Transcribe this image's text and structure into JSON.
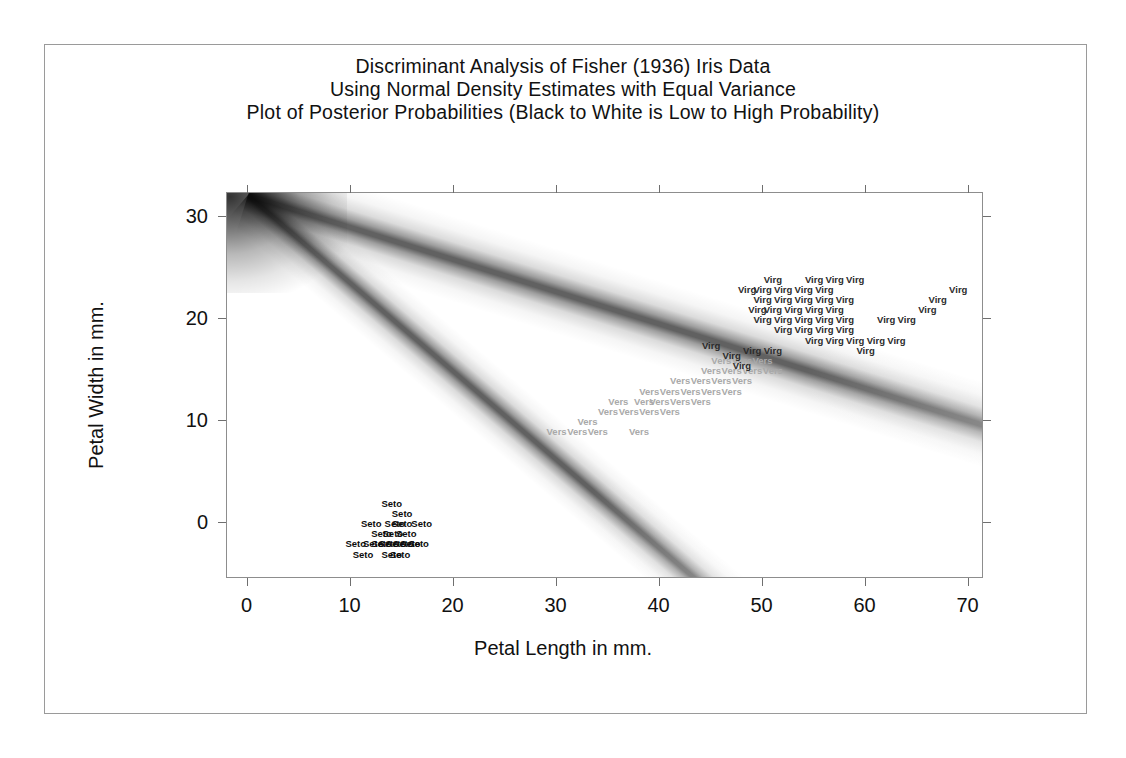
{
  "title": {
    "line1": "Discriminant Analysis of Fisher (1936) Iris Data",
    "line2": "Using Normal Density Estimates with Equal Variance",
    "line3": "Plot of Posterior Probabilities (Black to White is Low to High Probability)"
  },
  "axes": {
    "xlabel": "Petal Length in mm.",
    "ylabel": "Petal Width in mm.",
    "xticks": [
      "0",
      "10",
      "20",
      "30",
      "40",
      "50",
      "60",
      "70"
    ],
    "yticks": [
      "0",
      "10",
      "20",
      "30"
    ],
    "xlim": [
      -2,
      71.5
    ],
    "ylim": [
      -5.5,
      32.4
    ]
  },
  "chart_data": {
    "type": "scatter",
    "title": "Discriminant Analysis of Fisher (1936) Iris Data",
    "subtitle": "Using Normal Density Estimates with Equal Variance",
    "annotation": "Plot of Posterior Probabilities (Black to White is Low to High Probability)",
    "xlabel": "Petal Length in mm.",
    "ylabel": "Petal Width in mm.",
    "xlim": [
      -2,
      71.5
    ],
    "ylim": [
      -5.5,
      32.4
    ],
    "grid": false,
    "legend": "none",
    "background": "posterior probability density shading: two dark decision-boundary ridges radiating from upper-left corner; black = low probability, white = high probability",
    "boundaries": [
      {
        "name": "seto-vers-boundary",
        "from": [
          0,
          32.2
        ],
        "to": [
          43.5,
          -5.5
        ]
      },
      {
        "name": "vers-virg-boundary",
        "from": [
          0,
          32.2
        ],
        "to": [
          71.5,
          9.6
        ]
      }
    ],
    "series": [
      {
        "name": "Seto",
        "label": "Seto",
        "color": "#0c0c0c",
        "points": [
          [
            14.0,
            2.0
          ],
          [
            15.0,
            1.0
          ],
          [
            12.0,
            0.0
          ],
          [
            14.3,
            0.0
          ],
          [
            15.0,
            0.0
          ],
          [
            16.9,
            0.0
          ],
          [
            13.0,
            -1.0
          ],
          [
            14.1,
            -1.0
          ],
          [
            15.4,
            -1.0
          ],
          [
            10.5,
            -2.0
          ],
          [
            12.2,
            -2.0
          ],
          [
            13.0,
            -2.0
          ],
          [
            13.7,
            -2.0
          ],
          [
            14.4,
            -2.0
          ],
          [
            15.1,
            -2.0
          ],
          [
            15.8,
            -2.0
          ],
          [
            16.6,
            -2.0
          ],
          [
            11.2,
            -3.0
          ],
          [
            14.0,
            -3.0
          ],
          [
            14.8,
            -3.0
          ]
        ]
      },
      {
        "name": "Vers",
        "label": "Vers",
        "color": "#a9a9a9",
        "points": [
          [
            33.0,
            10.0
          ],
          [
            30.0,
            9.0
          ],
          [
            32.0,
            9.0
          ],
          [
            34.0,
            9.0
          ],
          [
            38.0,
            9.0
          ],
          [
            35.0,
            11.0
          ],
          [
            37.0,
            11.0
          ],
          [
            39.0,
            11.0
          ],
          [
            41.0,
            11.0
          ],
          [
            36.0,
            12.0
          ],
          [
            38.5,
            12.0
          ],
          [
            40.0,
            12.0
          ],
          [
            42.0,
            12.0
          ],
          [
            44.0,
            12.0
          ],
          [
            39.0,
            13.0
          ],
          [
            41.0,
            13.0
          ],
          [
            43.0,
            13.0
          ],
          [
            45.0,
            13.0
          ],
          [
            47.0,
            13.0
          ],
          [
            42.0,
            14.0
          ],
          [
            44.0,
            14.0
          ],
          [
            46.0,
            14.0
          ],
          [
            48.0,
            14.0
          ],
          [
            45.0,
            15.0
          ],
          [
            47.0,
            15.0
          ],
          [
            49.0,
            15.0
          ],
          [
            51.0,
            15.0
          ],
          [
            46.0,
            16.0
          ],
          [
            48.0,
            16.0
          ],
          [
            50.0,
            16.0
          ]
        ]
      },
      {
        "name": "Virg",
        "label": "Virg",
        "color": "#2b2b2b",
        "points": [
          [
            49.0,
            17.0
          ],
          [
            51.0,
            17.0
          ],
          [
            55.0,
            18.0
          ],
          [
            57.0,
            18.0
          ],
          [
            59.0,
            18.0
          ],
          [
            61.0,
            18.0
          ],
          [
            63.0,
            18.0
          ],
          [
            52.0,
            19.0
          ],
          [
            54.0,
            19.0
          ],
          [
            56.0,
            19.0
          ],
          [
            58.0,
            19.0
          ],
          [
            50.0,
            20.0
          ],
          [
            52.0,
            20.0
          ],
          [
            54.0,
            20.0
          ],
          [
            56.0,
            20.0
          ],
          [
            58.0,
            20.0
          ],
          [
            62.0,
            20.0
          ],
          [
            64.0,
            20.0
          ],
          [
            49.5,
            21.0
          ],
          [
            51.0,
            21.0
          ],
          [
            53.0,
            21.0
          ],
          [
            55.0,
            21.0
          ],
          [
            57.0,
            21.0
          ],
          [
            66.0,
            21.0
          ],
          [
            50.0,
            22.0
          ],
          [
            52.0,
            22.0
          ],
          [
            54.0,
            22.0
          ],
          [
            56.0,
            22.0
          ],
          [
            58.0,
            22.0
          ],
          [
            67.0,
            22.0
          ],
          [
            48.5,
            23.0
          ],
          [
            50.0,
            23.0
          ],
          [
            52.0,
            23.0
          ],
          [
            54.0,
            23.0
          ],
          [
            56.0,
            23.0
          ],
          [
            69.0,
            23.0
          ],
          [
            51.0,
            24.0
          ],
          [
            55.0,
            24.0
          ],
          [
            57.0,
            24.0
          ],
          [
            59.0,
            24.0
          ],
          [
            45.0,
            17.5
          ],
          [
            47.0,
            16.5
          ],
          [
            60.0,
            17.0
          ],
          [
            48.0,
            15.5
          ]
        ]
      }
    ]
  }
}
